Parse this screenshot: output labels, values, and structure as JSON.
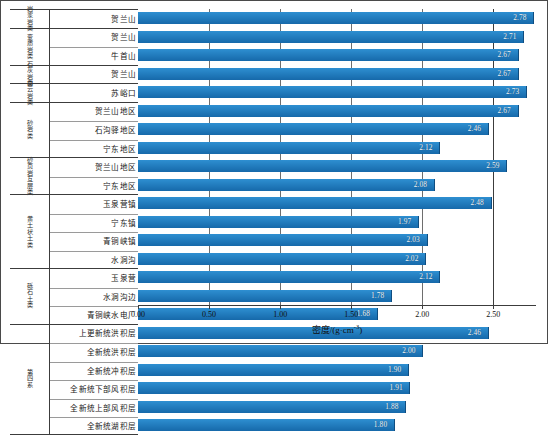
{
  "chart_data": {
    "type": "bar",
    "orientation": "horizontal",
    "title": "",
    "xlabel": "密度/(g·cm-3)",
    "xlabel_base": "密度/(g·cm",
    "xlabel_sup": "-3",
    "xlabel_tail": ")",
    "ylabel": "",
    "xlim": [
      0.0,
      2.8
    ],
    "xticks": [
      0.0,
      0.5,
      1.0,
      1.5,
      2.0,
      2.5
    ],
    "xticklabels": [
      "0.00",
      "0.50",
      "1.00",
      "1.50",
      "2.00",
      "2.50"
    ],
    "grid": "vertical",
    "legend": "none",
    "bar_color": "#1f7cc0",
    "categories": [
      "贺兰山",
      "贺兰山",
      "牛首山",
      "贺兰山",
      "苏峪口",
      "贺兰山地区",
      "石沟驿地区",
      "宁东地区",
      "贺兰山地区",
      "宁东地区",
      "玉泉营镇",
      "宁东镇",
      "青铜峡镇",
      "水洞沟",
      "玉泉营",
      "水洞沟边",
      "青铜峡水电厂",
      "上更新统洪积层",
      "全新统洪积层",
      "全新统冲积层",
      "全新统下部风积层",
      "全新统上部风积层",
      "全新统湖积层"
    ],
    "values": [
      2.78,
      2.71,
      2.67,
      2.67,
      2.73,
      2.67,
      2.46,
      2.12,
      2.59,
      2.08,
      2.48,
      1.97,
      2.03,
      2.02,
      2.12,
      1.78,
      1.68,
      2.46,
      2.0,
      1.9,
      1.91,
      1.88,
      1.8
    ],
    "datalabels": [
      "2.78",
      "2.71",
      "2.67",
      "2.67",
      "2.73",
      "2.67",
      "2.46",
      "2.12",
      "2.59",
      "2.08",
      "2.48",
      "1.97",
      "2.03",
      "2.02",
      "2.12",
      "1.78",
      "1.68",
      "2.46",
      "2.00",
      "1.90",
      "1.91",
      "1.88",
      "1.80"
    ]
  },
  "table": {
    "groups": [
      {
        "category": "岩浆岩类",
        "rows": [
          {
            "site": "贺兰山",
            "value": "2.78"
          }
        ]
      },
      {
        "category": "变质岩类",
        "rows": [
          {
            "site": "贺兰山",
            "value": "2.71"
          },
          {
            "site": "牛首山",
            "value": "2.67"
          }
        ]
      },
      {
        "category": "石灰岩类",
        "rows": [
          {
            "site": "贺兰山",
            "value": "2.67"
          }
        ]
      },
      {
        "category": "白云岩类",
        "rows": [
          {
            "site": "苏峪口",
            "value": "2.73"
          }
        ]
      },
      {
        "category": "砂岩类",
        "rows": [
          {
            "site": "贺兰山地区",
            "value": "2.67"
          },
          {
            "site": "石沟驿地区",
            "value": "2.46"
          },
          {
            "site": "宁东地区",
            "value": "2.12"
          }
        ]
      },
      {
        "category": "砂页岩互层类",
        "rows": [
          {
            "site": "贺兰山地区",
            "value": "2.59"
          },
          {
            "site": "宁东地区",
            "value": "2.08"
          }
        ]
      },
      {
        "category": "黄土状土类",
        "rows": [
          {
            "site": "玉泉营镇",
            "value": "2.48"
          },
          {
            "site": "宁东镇",
            "value": "1.97"
          },
          {
            "site": "青铜峡镇",
            "value": "2.03"
          },
          {
            "site": "水洞沟",
            "value": "2.02"
          }
        ]
      },
      {
        "category": "砾石土类",
        "rows": [
          {
            "site": "玉泉营",
            "value": "2.12"
          },
          {
            "site": "水洞沟边",
            "value": "1.78"
          },
          {
            "site": "青铜峡水电厂",
            "value": "1.68"
          }
        ]
      },
      {
        "category": "第四系",
        "rows": [
          {
            "site": "上更新统洪积层",
            "value": "2.46"
          },
          {
            "site": "全新统洪积层",
            "value": "2.00"
          },
          {
            "site": "全新统冲积层",
            "value": "1.90"
          },
          {
            "site": "全新统下部风积层",
            "value": "1.91"
          },
          {
            "site": "全新统上部风积层",
            "value": "1.88"
          },
          {
            "site": "全新统湖积层",
            "value": "1.80"
          }
        ]
      }
    ]
  }
}
